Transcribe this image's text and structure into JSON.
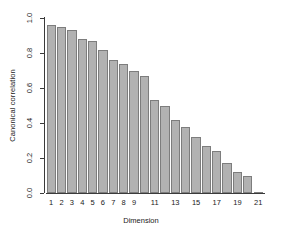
{
  "chart_data": {
    "type": "bar",
    "title": "",
    "xlabel": "Dimension",
    "ylabel": "Canonical correlation",
    "categories": [
      "1",
      "2",
      "3",
      "4",
      "5",
      "6",
      "7",
      "8",
      "9",
      "10",
      "11",
      "12",
      "13",
      "14",
      "15",
      "16",
      "17",
      "18",
      "19",
      "20",
      "21"
    ],
    "values": [
      0.96,
      0.95,
      0.93,
      0.88,
      0.87,
      0.82,
      0.76,
      0.74,
      0.7,
      0.67,
      0.53,
      0.5,
      0.42,
      0.38,
      0.32,
      0.27,
      0.24,
      0.17,
      0.12,
      0.1,
      0.005
    ],
    "ylim": [
      0.0,
      1.0
    ],
    "xlim": [
      0.5,
      21.5
    ],
    "ytick_labels": [
      "0.0",
      "0.2",
      "0.4",
      "0.6",
      "0.8",
      "1.0"
    ],
    "ytick_values": [
      0.0,
      0.2,
      0.4,
      0.6,
      0.8,
      1.0
    ],
    "xtick_labels": [
      "1",
      "2",
      "3",
      "4",
      "5",
      "6",
      "7",
      "8",
      "9",
      "11",
      "13",
      "15",
      "17",
      "19",
      "21"
    ],
    "xtick_values": [
      1,
      2,
      3,
      4,
      5,
      6,
      7,
      8,
      9,
      11,
      13,
      15,
      17,
      19,
      21
    ],
    "grid": false,
    "legend": null,
    "bar_fill_color": "#b2b2b2",
    "bar_border_color": "#7d7d7d",
    "axis_color": "#3a3a3a",
    "background_color": "#ffffff"
  }
}
